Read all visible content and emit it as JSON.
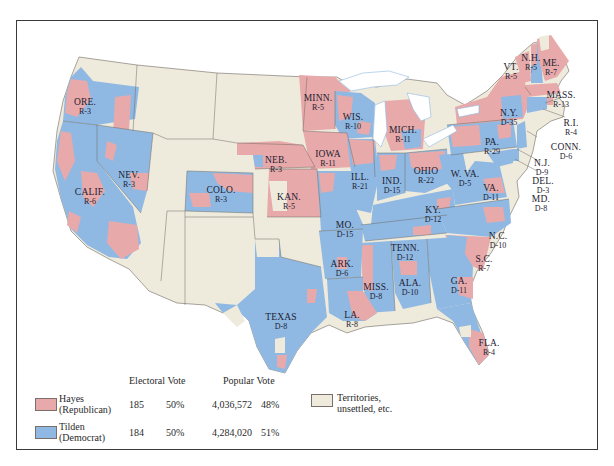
{
  "colors": {
    "republican": "#e8a9aa",
    "democrat": "#8fb9e3",
    "territory": "#eeeadc",
    "water": "#ffffff",
    "border": "#6e6a62"
  },
  "states": [
    {
      "id": "ore",
      "name": "ORE.",
      "ev": "R-3",
      "x": 68,
      "y": 77
    },
    {
      "id": "calif",
      "name": "CALIF.",
      "ev": "R-6",
      "x": 73,
      "y": 167
    },
    {
      "id": "nev",
      "name": "NEV.",
      "ev": "R-3",
      "x": 112,
      "y": 150
    },
    {
      "id": "colo",
      "name": "COLO.",
      "ev": "R-3",
      "x": 204,
      "y": 165
    },
    {
      "id": "neb",
      "name": "NEB.",
      "ev": "R-3",
      "x": 259,
      "y": 135
    },
    {
      "id": "kan",
      "name": "KAN.",
      "ev": "R-5",
      "x": 272,
      "y": 172
    },
    {
      "id": "minn",
      "name": "MINN.",
      "ev": "R-5",
      "x": 301,
      "y": 73
    },
    {
      "id": "iowa",
      "name": "IOWA",
      "ev": "R-11",
      "x": 311,
      "y": 129
    },
    {
      "id": "wis",
      "name": "WIS.",
      "ev": "R-10",
      "x": 336,
      "y": 92
    },
    {
      "id": "mich",
      "name": "MICH.",
      "ev": "R-11",
      "x": 386,
      "y": 105
    },
    {
      "id": "ill",
      "name": "ILL.",
      "ev": "R-21",
      "x": 343,
      "y": 152
    },
    {
      "id": "ind",
      "name": "IND.",
      "ev": "D-15",
      "x": 375,
      "y": 156
    },
    {
      "id": "ohio",
      "name": "OHIO",
      "ev": "R-22",
      "x": 409,
      "y": 146
    },
    {
      "id": "mo",
      "name": "MO.",
      "ev": "D-15",
      "x": 328,
      "y": 200
    },
    {
      "id": "ky",
      "name": "KY.",
      "ev": "D-12",
      "x": 416,
      "y": 185
    },
    {
      "id": "wva",
      "name": "W. VA.",
      "ev": "D-5",
      "x": 448,
      "y": 149
    },
    {
      "id": "va",
      "name": "VA.",
      "ev": "D-11",
      "x": 474,
      "y": 163
    },
    {
      "id": "pa",
      "name": "PA.",
      "ev": "R-29",
      "x": 475,
      "y": 117
    },
    {
      "id": "ny",
      "name": "N.Y.",
      "ev": "D-35",
      "x": 492,
      "y": 88
    },
    {
      "id": "vt",
      "name": "VT.",
      "ev": "R-5",
      "x": 494,
      "y": 42
    },
    {
      "id": "nh",
      "name": "N.H.",
      "ev": "R-5",
      "x": 514,
      "y": 33
    },
    {
      "id": "me",
      "name": "ME.",
      "ev": "R-7",
      "x": 534,
      "y": 38
    },
    {
      "id": "mass",
      "name": "MASS.",
      "ev": "R-13",
      "x": 544,
      "y": 70
    },
    {
      "id": "ri",
      "name": "R.I.",
      "ev": "R-4",
      "x": 554,
      "y": 98
    },
    {
      "id": "conn",
      "name": "CONN.",
      "ev": "D-6",
      "x": 549,
      "y": 122
    },
    {
      "id": "nj",
      "name": "N.J.",
      "ev": "D-9",
      "x": 525,
      "y": 138
    },
    {
      "id": "del",
      "name": "DEL.",
      "ev": "D-3",
      "x": 526,
      "y": 156
    },
    {
      "id": "md",
      "name": "MD.",
      "ev": "D-8",
      "x": 524,
      "y": 174
    },
    {
      "id": "nc",
      "name": "N.C.",
      "ev": "D-10",
      "x": 481,
      "y": 211
    },
    {
      "id": "tenn",
      "name": "TENN.",
      "ev": "D-12",
      "x": 388,
      "y": 223
    },
    {
      "id": "ark",
      "name": "ARK.",
      "ev": "D-6",
      "x": 325,
      "y": 239
    },
    {
      "id": "sc",
      "name": "S.C.",
      "ev": "R-7",
      "x": 467,
      "y": 234
    },
    {
      "id": "miss",
      "name": "MISS.",
      "ev": "D-8",
      "x": 359,
      "y": 262
    },
    {
      "id": "ala",
      "name": "ALA.",
      "ev": "D-10",
      "x": 393,
      "y": 258
    },
    {
      "id": "ga",
      "name": "GA.",
      "ev": "D-11",
      "x": 442,
      "y": 256
    },
    {
      "id": "la",
      "name": "LA.",
      "ev": "R-8",
      "x": 335,
      "y": 290
    },
    {
      "id": "texas",
      "name": "TEXAS",
      "ev": "D-8",
      "x": 264,
      "y": 292
    },
    {
      "id": "fla",
      "name": "FLA.",
      "ev": "R-4",
      "x": 472,
      "y": 318
    }
  ],
  "legend": {
    "header_electoral": "Electoral Vote",
    "header_popular": "Popular Vote",
    "rows": [
      {
        "party": "Hayes",
        "party_sub": "(Republican)",
        "ev": "185",
        "ev_pct": "50%",
        "pop": "4,036,572",
        "pop_pct": "48%"
      },
      {
        "party": "Tilden",
        "party_sub": "(Democrat)",
        "ev": "184",
        "ev_pct": "50%",
        "pop": "4,284,020",
        "pop_pct": "51%"
      }
    ],
    "territory_label_1": "Territories,",
    "territory_label_2": "unsettled, etc."
  }
}
